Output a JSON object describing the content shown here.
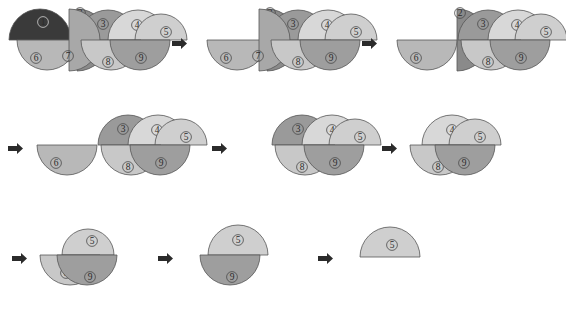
{
  "figure": {
    "title": "",
    "background_color": "#ffffff",
    "outline_color": "#555555",
    "label_color": "#2a2a2a",
    "arrow_color": "#2b2b2b",
    "arrow_glyph": "right-arrow",
    "rows": 3,
    "panels_per_row": 3,
    "total_panels": 9
  },
  "palette": {
    "piece_1": "#3a3a3a",
    "piece_2": "#8a8a8a",
    "piece_3": "#9a9a9a",
    "piece_4": "#d8d8d8",
    "piece_5": "#cfcfcf",
    "piece_6": "#b8b8b8",
    "piece_7": "#a8a8a8",
    "piece_8": "#c8c8c8",
    "piece_9": "#9e9e9e"
  },
  "pieces": [
    {
      "id": "1",
      "label": "①",
      "color": "#3a3a3a",
      "shape": "half-disc-up"
    },
    {
      "id": "2",
      "label": "②",
      "color": "#8a8a8a",
      "shape": "half-disc-right"
    },
    {
      "id": "3",
      "label": "③",
      "color": "#9a9a9a",
      "shape": "half-disc-up"
    },
    {
      "id": "4",
      "label": "④",
      "color": "#d8d8d8",
      "shape": "half-disc-up"
    },
    {
      "id": "5",
      "label": "⑤",
      "color": "#cfcfcf",
      "shape": "half-disc-up"
    },
    {
      "id": "6",
      "label": "⑥",
      "color": "#b8b8b8",
      "shape": "half-disc-down"
    },
    {
      "id": "7",
      "label": "⑦",
      "color": "#a8a8a8",
      "shape": "half-disc-right"
    },
    {
      "id": "8",
      "label": "⑧",
      "color": "#c8c8c8",
      "shape": "half-disc-down"
    },
    {
      "id": "9",
      "label": "⑨",
      "color": "#9e9e9e",
      "shape": "half-disc-down"
    }
  ],
  "panels": [
    {
      "index": 1,
      "name": "panel-1",
      "row": 1,
      "leading_arrow": false,
      "visible_pieces": [
        "1",
        "2",
        "3",
        "4",
        "5",
        "6",
        "7",
        "8",
        "9"
      ],
      "removed_piece": null,
      "caption": ""
    },
    {
      "index": 2,
      "name": "panel-2",
      "row": 1,
      "leading_arrow": true,
      "visible_pieces": [
        "2",
        "3",
        "4",
        "5",
        "6",
        "7",
        "8",
        "9"
      ],
      "removed_piece": "1",
      "caption": ""
    },
    {
      "index": 3,
      "name": "panel-3",
      "row": 1,
      "leading_arrow": true,
      "visible_pieces": [
        "2",
        "3",
        "4",
        "5",
        "6",
        "8",
        "9"
      ],
      "removed_piece": "7",
      "caption": ""
    },
    {
      "index": 4,
      "name": "panel-4",
      "row": 2,
      "leading_arrow": true,
      "visible_pieces": [
        "3",
        "4",
        "5",
        "6",
        "8",
        "9"
      ],
      "removed_piece": "2",
      "caption": ""
    },
    {
      "index": 5,
      "name": "panel-5",
      "row": 2,
      "leading_arrow": true,
      "visible_pieces": [
        "3",
        "4",
        "5",
        "8",
        "9"
      ],
      "removed_piece": "6",
      "caption": ""
    },
    {
      "index": 6,
      "name": "panel-6",
      "row": 2,
      "leading_arrow": true,
      "visible_pieces": [
        "4",
        "5",
        "8",
        "9"
      ],
      "removed_piece": "3",
      "caption": ""
    },
    {
      "index": 7,
      "name": "panel-7",
      "row": 3,
      "leading_arrow": true,
      "visible_pieces": [
        "5",
        "8",
        "9"
      ],
      "removed_piece": "4",
      "caption": ""
    },
    {
      "index": 8,
      "name": "panel-8",
      "row": 3,
      "leading_arrow": true,
      "visible_pieces": [
        "5",
        "9"
      ],
      "removed_piece": "8",
      "caption": ""
    },
    {
      "index": 9,
      "name": "panel-9",
      "row": 3,
      "leading_arrow": true,
      "visible_pieces": [
        "5"
      ],
      "removed_piece": "9",
      "caption": ""
    }
  ],
  "removal_order": [
    "1",
    "7",
    "2",
    "6",
    "3",
    "4",
    "8",
    "9"
  ],
  "final_remaining_piece": "5"
}
